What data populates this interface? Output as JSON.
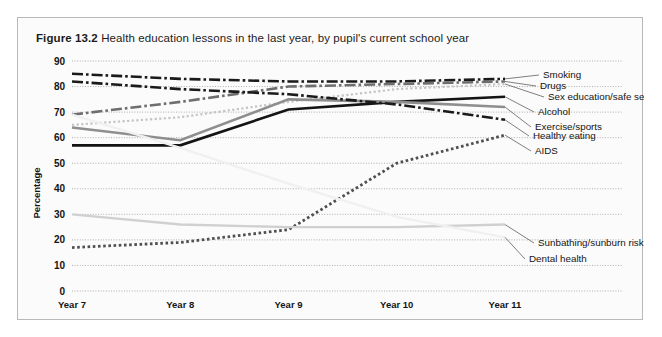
{
  "figure": {
    "number": "Figure 13.2",
    "title": "Health education lessons in the last year, by pupil's current school year"
  },
  "chart_data": {
    "type": "line",
    "title": "Health education lessons in the last year, by pupil's current school year",
    "xlabel": "",
    "ylabel": "Percentage",
    "categories": [
      "Year 7",
      "Year 8",
      "Year 9",
      "Year 10",
      "Year 11"
    ],
    "ylim": [
      0,
      90
    ],
    "ytick_step": 10,
    "yticks": [
      "0",
      "10",
      "20",
      "30",
      "40",
      "50",
      "60",
      "70",
      "80",
      "90"
    ],
    "grid": true,
    "legend_position": "right-inline-labels",
    "series": [
      {
        "name": "Smoking",
        "values": [
          85,
          83,
          82,
          82,
          83
        ],
        "style": "dash-dot",
        "color": "#1a1a1a",
        "width": 2.6
      },
      {
        "name": "Drugs",
        "values": [
          69,
          74,
          80,
          81,
          82
        ],
        "style": "dash-dot",
        "color": "#6e6e6e",
        "width": 2.6
      },
      {
        "name": "Sex education/safe sex",
        "values": [
          65,
          68,
          74,
          79,
          81
        ],
        "style": "dotted",
        "color": "#c4c4c4",
        "width": 2.2
      },
      {
        "name": "Alcohol",
        "values": [
          57,
          57,
          71,
          74,
          76
        ],
        "style": "solid",
        "color": "#141414",
        "width": 2.6
      },
      {
        "name": "Exercise/sports",
        "values": [
          64,
          59,
          75,
          74,
          72
        ],
        "style": "solid",
        "color": "#8e8e8e",
        "width": 2.6
      },
      {
        "name": "Healthy eating",
        "values": [
          82,
          79,
          77,
          73,
          67
        ],
        "style": "dash-dot",
        "color": "#1a1a1a",
        "width": 2.6
      },
      {
        "name": "AIDS",
        "values": [
          17,
          19,
          24,
          50,
          61
        ],
        "style": "dotted-square",
        "color": "#4f4f4f",
        "width": 2.8
      },
      {
        "name": "Sunbathing/sunburn risks",
        "values": [
          30,
          26,
          25,
          25,
          26
        ],
        "style": "solid",
        "color": "#d0d0d0",
        "width": 2.4
      },
      {
        "name": "Dental health",
        "values": [
          69,
          56,
          42,
          29,
          21
        ],
        "style": "solid-light",
        "color": "#f0f0f0",
        "width": 2.4
      }
    ]
  },
  "legend": {
    "items": [
      {
        "label": "Smoking"
      },
      {
        "label": "Drugs"
      },
      {
        "label": "Sex education/safe sex"
      },
      {
        "label": "Alcohol"
      },
      {
        "label": "Exercise/sports"
      },
      {
        "label": "Healthy eating"
      },
      {
        "label": "AIDS"
      },
      {
        "label": "Sunbathing/sunburn risks"
      },
      {
        "label": "Dental health"
      }
    ]
  }
}
